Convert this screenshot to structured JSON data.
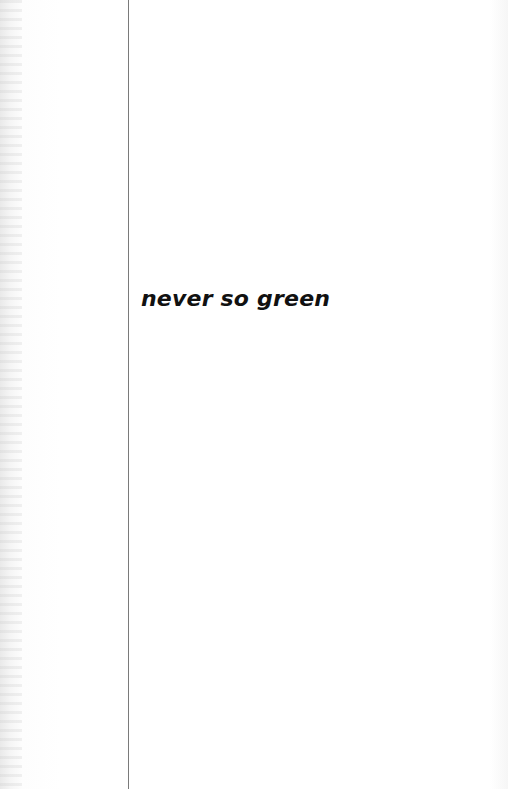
{
  "page": {
    "title": "never so green"
  },
  "colors": {
    "background": "#ffffff",
    "rule": "#7a7a7a",
    "text": "#111111"
  }
}
